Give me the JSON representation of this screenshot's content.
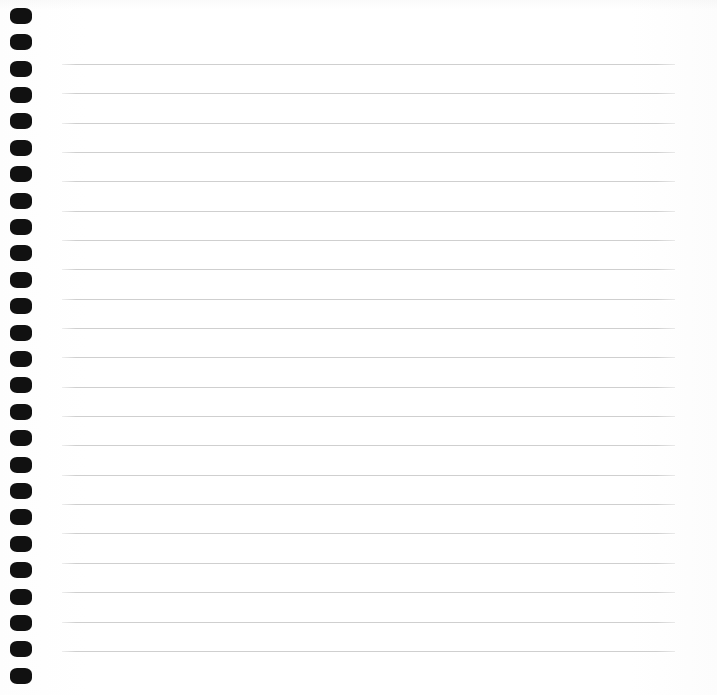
{
  "page": {
    "width_px": 717,
    "height_px": 695,
    "background_color": "#ffffff",
    "paper_color": "#fefefe",
    "content_text": ""
  },
  "spiral_binding": {
    "name": "spiral-binding",
    "hole_color": "#111111",
    "hole_count": 26,
    "hole_width_px": 22,
    "hole_height_px": 16,
    "hole_left_px": 10,
    "first_hole_top_px": 8,
    "hole_spacing_px": 26.5,
    "holes": [
      {
        "index": 1,
        "top_px": 8
      },
      {
        "index": 2,
        "top_px": 34
      },
      {
        "index": 3,
        "top_px": 61
      },
      {
        "index": 4,
        "top_px": 87
      },
      {
        "index": 5,
        "top_px": 113
      },
      {
        "index": 6,
        "top_px": 140
      },
      {
        "index": 7,
        "top_px": 166
      },
      {
        "index": 8,
        "top_px": 193
      },
      {
        "index": 9,
        "top_px": 219
      },
      {
        "index": 10,
        "top_px": 245
      },
      {
        "index": 11,
        "top_px": 272
      },
      {
        "index": 12,
        "top_px": 298
      },
      {
        "index": 13,
        "top_px": 325
      },
      {
        "index": 14,
        "top_px": 351
      },
      {
        "index": 15,
        "top_px": 377
      },
      {
        "index": 16,
        "top_px": 404
      },
      {
        "index": 17,
        "top_px": 430
      },
      {
        "index": 18,
        "top_px": 457
      },
      {
        "index": 19,
        "top_px": 483
      },
      {
        "index": 20,
        "top_px": 509
      },
      {
        "index": 21,
        "top_px": 536
      },
      {
        "index": 22,
        "top_px": 562
      },
      {
        "index": 23,
        "top_px": 589
      },
      {
        "index": 24,
        "top_px": 615
      },
      {
        "index": 25,
        "top_px": 641
      },
      {
        "index": 26,
        "top_px": 668
      }
    ]
  },
  "ruled_lines": {
    "name": "ruled-lines",
    "line_color": "#cfcfcf",
    "line_thickness_px": 1,
    "line_left_px": 62,
    "line_right_px": 675,
    "line_width_px": 613,
    "line_count": 21,
    "line_spacing_px": 29.3,
    "first_line_top_px": 64,
    "last_line_top_px": 650,
    "lines": [
      {
        "index": 1,
        "top_px": 64
      },
      {
        "index": 2,
        "top_px": 93
      },
      {
        "index": 3,
        "top_px": 123
      },
      {
        "index": 4,
        "top_px": 152
      },
      {
        "index": 5,
        "top_px": 181
      },
      {
        "index": 6,
        "top_px": 211
      },
      {
        "index": 7,
        "top_px": 240
      },
      {
        "index": 8,
        "top_px": 269
      },
      {
        "index": 9,
        "top_px": 299
      },
      {
        "index": 10,
        "top_px": 328
      },
      {
        "index": 11,
        "top_px": 357
      },
      {
        "index": 12,
        "top_px": 387
      },
      {
        "index": 13,
        "top_px": 416
      },
      {
        "index": 14,
        "top_px": 445
      },
      {
        "index": 15,
        "top_px": 475
      },
      {
        "index": 16,
        "top_px": 504
      },
      {
        "index": 17,
        "top_px": 533
      },
      {
        "index": 18,
        "top_px": 563
      },
      {
        "index": 19,
        "top_px": 592
      },
      {
        "index": 20,
        "top_px": 622
      },
      {
        "index": 21,
        "top_px": 651
      }
    ]
  }
}
